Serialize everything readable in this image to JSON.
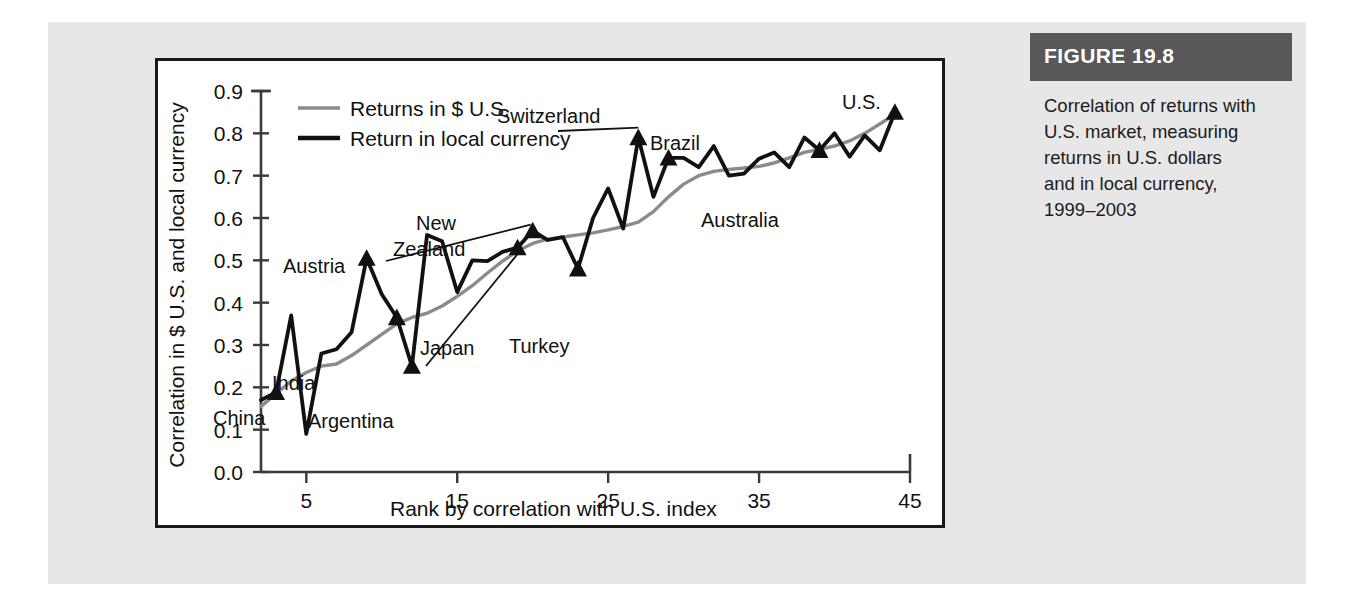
{
  "figure": {
    "header": "FIGURE 19.8",
    "caption_lines": [
      "Correlation of returns with",
      "U.S. market, measuring",
      "returns in U.S. dollars",
      "and in local currency,",
      "1999–2003"
    ]
  },
  "chart_data": {
    "type": "line",
    "title": "",
    "xlabel": "Rank by correlation with U.S. index",
    "ylabel": "Correlation in $ U.S. and local currency",
    "xlim": [
      2,
      45
    ],
    "ylim": [
      0.0,
      0.9
    ],
    "xticks": [
      5,
      15,
      25,
      35,
      45
    ],
    "yticks": [
      "0.0",
      "0.1",
      "0.2",
      "0.3",
      "0.4",
      "0.5",
      "0.6",
      "0.7",
      "0.8",
      "0.9"
    ],
    "grid": false,
    "legend_position": "top-left",
    "colors": {
      "usd": "#8b8b8b",
      "local": "#111111"
    },
    "x": [
      2,
      3,
      4,
      5,
      6,
      7,
      8,
      9,
      10,
      11,
      12,
      13,
      14,
      15,
      16,
      17,
      18,
      19,
      20,
      21,
      22,
      23,
      24,
      25,
      26,
      27,
      28,
      29,
      30,
      31,
      32,
      33,
      34,
      35,
      36,
      37,
      38,
      39,
      40,
      41,
      42,
      43,
      44
    ],
    "series": [
      {
        "name": "Returns in $ U.S.",
        "color": "#8b8b8b",
        "values": [
          0.155,
          0.185,
          0.215,
          0.235,
          0.25,
          0.255,
          0.275,
          0.3,
          0.325,
          0.35,
          0.365,
          0.375,
          0.392,
          0.415,
          0.44,
          0.47,
          0.498,
          0.522,
          0.54,
          0.55,
          0.555,
          0.56,
          0.565,
          0.572,
          0.58,
          0.59,
          0.615,
          0.65,
          0.68,
          0.7,
          0.71,
          0.715,
          0.718,
          0.722,
          0.73,
          0.742,
          0.755,
          0.762,
          0.77,
          0.782,
          0.8,
          0.822,
          0.845
        ]
      },
      {
        "name": "Return in local currency",
        "color": "#111111",
        "values": [
          0.17,
          0.188,
          0.37,
          0.09,
          0.28,
          0.29,
          0.33,
          0.505,
          0.42,
          0.365,
          0.25,
          0.56,
          0.545,
          0.425,
          0.5,
          0.498,
          0.52,
          0.53,
          0.57,
          0.548,
          0.555,
          0.48,
          0.6,
          0.67,
          0.575,
          0.79,
          0.65,
          0.742,
          0.742,
          0.72,
          0.77,
          0.7,
          0.705,
          0.74,
          0.755,
          0.72,
          0.79,
          0.76,
          0.8,
          0.745,
          0.795,
          0.76,
          0.85
        ]
      }
    ],
    "annotations": [
      {
        "label": "China",
        "x": 3,
        "y": 0.188,
        "marker": true
      },
      {
        "label": "Austria",
        "x": 9,
        "y": 0.505,
        "marker": true
      },
      {
        "label": "India",
        "x": 11,
        "y": 0.365,
        "marker": true
      },
      {
        "label": "Argentina",
        "x": 12,
        "y": 0.25,
        "marker": true
      },
      {
        "label": "New Zealand",
        "x": 20,
        "y": 0.57,
        "marker": true
      },
      {
        "label": "Japan",
        "x": 19,
        "y": 0.53,
        "marker": true
      },
      {
        "label": "Turkey",
        "x": 23,
        "y": 0.48,
        "marker": true
      },
      {
        "label": "Switzerland",
        "x": 27,
        "y": 0.79,
        "marker": true
      },
      {
        "label": "Brazil",
        "x": 29,
        "y": 0.742,
        "marker": true
      },
      {
        "label": "Australia",
        "x": 39,
        "y": 0.76,
        "marker": true
      },
      {
        "label": "U.S.",
        "x": 44,
        "y": 0.85,
        "marker": true
      }
    ],
    "annotation_text": {
      "china": "China",
      "austria": "Austria",
      "india": "India",
      "argentina": "Argentina",
      "new_zealand_1": "New",
      "new_zealand_2": "Zealand",
      "japan": "Japan",
      "turkey": "Turkey",
      "switzerland": "Switzerland",
      "brazil": "Brazil",
      "australia": "Australia",
      "us": "U.S."
    },
    "legend": [
      {
        "label": "Returns in $ U.S."
      },
      {
        "label": "Return in local currency"
      }
    ]
  }
}
